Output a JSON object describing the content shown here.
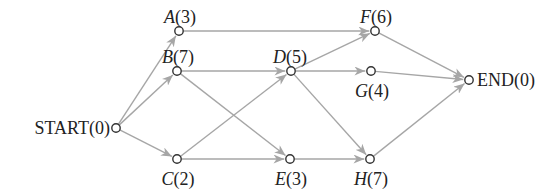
{
  "diagram": {
    "type": "activity-network",
    "edge_color": "#a6a6a6",
    "node_color": "#333333",
    "nodes": [
      {
        "id": "START",
        "name": "START",
        "duration": "0",
        "italic": false,
        "x": 116,
        "y": 128,
        "label_anchor": "end",
        "lx": 110,
        "ly": 134
      },
      {
        "id": "A",
        "name": "A",
        "duration": "3",
        "italic": true,
        "x": 179,
        "y": 31,
        "label_anchor": "middle",
        "lx": 180,
        "ly": 23
      },
      {
        "id": "B",
        "name": "B",
        "duration": "7",
        "italic": true,
        "x": 177,
        "y": 71,
        "label_anchor": "middle",
        "lx": 178,
        "ly": 63
      },
      {
        "id": "C",
        "name": "C",
        "duration": "2",
        "italic": true,
        "x": 177,
        "y": 159,
        "label_anchor": "middle",
        "lx": 178,
        "ly": 185
      },
      {
        "id": "D",
        "name": "D",
        "duration": "5",
        "italic": true,
        "x": 291,
        "y": 71,
        "label_anchor": "middle",
        "lx": 290,
        "ly": 63
      },
      {
        "id": "E",
        "name": "E",
        "duration": "3",
        "italic": true,
        "x": 290,
        "y": 159,
        "label_anchor": "middle",
        "lx": 291,
        "ly": 185
      },
      {
        "id": "F",
        "name": "F",
        "duration": "6",
        "italic": true,
        "x": 375,
        "y": 31,
        "label_anchor": "middle",
        "lx": 376,
        "ly": 23
      },
      {
        "id": "G",
        "name": "G",
        "duration": "4",
        "italic": true,
        "x": 371,
        "y": 71,
        "label_anchor": "middle",
        "lx": 372,
        "ly": 97
      },
      {
        "id": "H",
        "name": "H",
        "duration": "7",
        "italic": true,
        "x": 370,
        "y": 159,
        "label_anchor": "middle",
        "lx": 371,
        "ly": 185
      },
      {
        "id": "END",
        "name": "END",
        "duration": "0",
        "italic": false,
        "x": 469,
        "y": 80,
        "label_anchor": "start",
        "lx": 477,
        "ly": 86
      }
    ],
    "edges": [
      {
        "from": "START",
        "to": "A"
      },
      {
        "from": "START",
        "to": "B"
      },
      {
        "from": "START",
        "to": "C"
      },
      {
        "from": "A",
        "to": "F"
      },
      {
        "from": "B",
        "to": "D"
      },
      {
        "from": "B",
        "to": "E"
      },
      {
        "from": "C",
        "to": "D"
      },
      {
        "from": "C",
        "to": "E"
      },
      {
        "from": "D",
        "to": "F"
      },
      {
        "from": "D",
        "to": "G"
      },
      {
        "from": "D",
        "to": "H"
      },
      {
        "from": "E",
        "to": "H"
      },
      {
        "from": "F",
        "to": "END"
      },
      {
        "from": "G",
        "to": "END"
      },
      {
        "from": "H",
        "to": "END"
      }
    ]
  }
}
